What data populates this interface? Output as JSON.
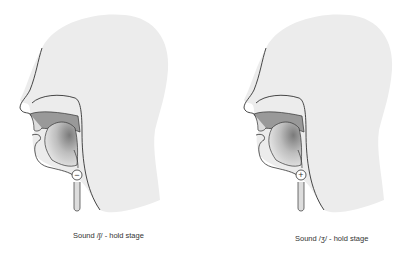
{
  "diagrams": [
    {
      "caption": "Sound /ʃ/ - hold stage",
      "larynx_symbol": "−",
      "voicing": "voiceless"
    },
    {
      "caption": "Sound /ʒ/ - hold stage",
      "larynx_symbol": "+",
      "voicing": "voiced"
    }
  ],
  "colors": {
    "head_fill": "#ececec",
    "outline": "#333333",
    "nasal_cavity": "#999999",
    "oral_cavity_dark": "#8a8a8a"
  }
}
